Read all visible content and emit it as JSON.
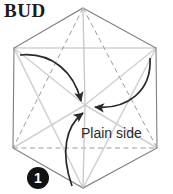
{
  "figure": {
    "title": "BUD",
    "label_plain_side": "Plain side",
    "step_number": "1",
    "colors": {
      "outline": "#7d7d85",
      "crease_dashed": "#9b9ba3",
      "fold_triangle": "#d2d2d6",
      "arrow": "#2a2a2a",
      "badge_background": "#121212",
      "badge_text": "#ffffff",
      "title_text": "#1a1a1a",
      "label_text": "#2b2b2b",
      "page_background": "#ffffff"
    },
    "shape": {
      "name": "hexagon",
      "vertices": [
        {
          "name": "top",
          "x": 83,
          "y": 8
        },
        {
          "name": "upper-right",
          "x": 156,
          "y": 48
        },
        {
          "name": "right",
          "x": 157,
          "y": 148
        },
        {
          "name": "bottom",
          "x": 83,
          "y": 188
        },
        {
          "name": "left",
          "x": 13,
          "y": 148
        },
        {
          "name": "upper-left",
          "x": 14,
          "y": 48
        }
      ],
      "center": {
        "x": 85,
        "y": 105
      }
    },
    "creases": [
      {
        "name": "crease-top-to-left",
        "from": "top",
        "to": "left",
        "style": "dashed"
      },
      {
        "name": "crease-top-to-right",
        "from": "top",
        "to": "right",
        "style": "dashed"
      },
      {
        "name": "crease-left-to-right",
        "from": "left",
        "to": "right",
        "style": "dashed"
      },
      {
        "name": "crease-top-to-center",
        "from": "top",
        "to": "center",
        "style": "solid-light"
      },
      {
        "name": "crease-bottom-to-center",
        "from": "bottom",
        "to": "center",
        "style": "solid-light"
      }
    ],
    "fold_triangle": {
      "name": "fold-triangle",
      "points": [
        {
          "name": "upper-left",
          "x": 14,
          "y": 48
        },
        {
          "name": "upper-right",
          "x": 156,
          "y": 48
        },
        {
          "name": "bottom",
          "x": 83,
          "y": 188
        }
      ]
    },
    "arrows": [
      {
        "name": "fold-arrow-from-upper-left",
        "from": {
          "x": 20,
          "y": 55
        },
        "to": {
          "x": 82,
          "y": 103
        }
      },
      {
        "name": "fold-arrow-from-upper-right",
        "from": {
          "x": 150,
          "y": 58
        },
        "to": {
          "x": 92,
          "y": 107
        }
      },
      {
        "name": "fold-arrow-from-bottom",
        "from": {
          "x": 72,
          "y": 186
        },
        "to": {
          "x": 85,
          "y": 112
        }
      }
    ]
  }
}
